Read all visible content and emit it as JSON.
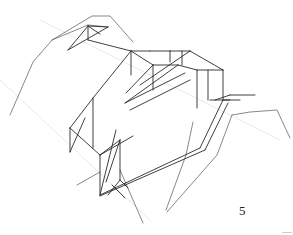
{
  "figure": {
    "label": "5",
    "stroke_color": "#2a2a2a",
    "light_stroke_color": "#6a6a6a",
    "faint_stroke_color": "#d8d8d8",
    "background": "#ffffff"
  },
  "chart_data": {
    "type": "diagram",
    "title": "",
    "annotations": [
      "5"
    ]
  },
  "terrain_polylines": [
    [
      [
        10,
        115
      ],
      [
        33,
        62
      ],
      [
        52,
        40
      ],
      [
        92,
        16
      ],
      [
        110,
        16
      ],
      [
        133,
        42
      ]
    ],
    [
      [
        52,
        40
      ],
      [
        88,
        25
      ],
      [
        108,
        27
      ]
    ],
    [
      [
        232,
        115
      ],
      [
        250,
        112
      ],
      [
        277,
        110
      ],
      [
        290,
        138
      ]
    ],
    [
      [
        232,
        115
      ],
      [
        217,
        155
      ],
      [
        167,
        212
      ]
    ],
    [
      [
        193,
        122
      ],
      [
        186,
        155
      ],
      [
        166,
        210
      ]
    ],
    [
      [
        77,
        185
      ],
      [
        100,
        172
      ]
    ],
    [
      [
        120,
        170
      ],
      [
        143,
        223
      ]
    ]
  ],
  "truss_lines": [
    [
      [
        68,
        50
      ],
      [
        88,
        26
      ]
    ],
    [
      [
        88,
        26
      ],
      [
        108,
        27
      ]
    ],
    [
      [
        88,
        26
      ],
      [
        100,
        34
      ]
    ],
    [
      [
        68,
        50
      ],
      [
        108,
        27
      ]
    ],
    [
      [
        88,
        26
      ],
      [
        88,
        40
      ]
    ],
    [
      [
        88,
        40
      ],
      [
        131,
        51
      ]
    ],
    [
      [
        131,
        51
      ],
      [
        131,
        75
      ]
    ],
    [
      [
        131,
        51
      ],
      [
        150,
        51
      ]
    ],
    [
      [
        131,
        51
      ],
      [
        93,
        98
      ]
    ],
    [
      [
        131,
        51
      ],
      [
        153,
        65
      ]
    ],
    [
      [
        150,
        51
      ],
      [
        170,
        51
      ]
    ],
    [
      [
        170,
        51
      ],
      [
        190,
        51
      ]
    ],
    [
      [
        190,
        51
      ],
      [
        223,
        70
      ]
    ],
    [
      [
        170,
        51
      ],
      [
        170,
        62
      ]
    ],
    [
      [
        182,
        51
      ],
      [
        182,
        65
      ]
    ],
    [
      [
        223,
        70
      ],
      [
        223,
        100
      ]
    ],
    [
      [
        223,
        70
      ],
      [
        197,
        70
      ]
    ],
    [
      [
        197,
        70
      ],
      [
        178,
        65
      ]
    ],
    [
      [
        153,
        65
      ],
      [
        178,
        65
      ]
    ],
    [
      [
        153,
        65
      ],
      [
        153,
        90
      ]
    ],
    [
      [
        153,
        65
      ],
      [
        126,
        93
      ]
    ],
    [
      [
        197,
        70
      ],
      [
        197,
        108
      ]
    ],
    [
      [
        208,
        70
      ],
      [
        208,
        100
      ]
    ],
    [
      [
        178,
        65
      ],
      [
        125,
        103
      ]
    ],
    [
      [
        190,
        51
      ],
      [
        140,
        85
      ]
    ],
    [
      [
        93,
        98
      ],
      [
        70,
        128
      ]
    ],
    [
      [
        93,
        98
      ],
      [
        93,
        148
      ]
    ],
    [
      [
        70,
        128
      ],
      [
        70,
        152
      ]
    ],
    [
      [
        70,
        128
      ],
      [
        100,
        155
      ]
    ],
    [
      [
        70,
        152
      ],
      [
        85,
        118
      ]
    ],
    [
      [
        100,
        155
      ],
      [
        133,
        136
      ]
    ],
    [
      [
        100,
        155
      ],
      [
        100,
        195
      ]
    ],
    [
      [
        100,
        155
      ],
      [
        120,
        140
      ]
    ],
    [
      [
        120,
        140
      ],
      [
        120,
        180
      ]
    ],
    [
      [
        120,
        140
      ],
      [
        106,
        182
      ]
    ],
    [
      [
        100,
        195
      ],
      [
        116,
        130
      ]
    ],
    [
      [
        100,
        195
      ],
      [
        200,
        148
      ]
    ],
    [
      [
        100,
        196
      ],
      [
        205,
        150
      ]
    ],
    [
      [
        125,
        103
      ],
      [
        185,
        73
      ]
    ],
    [
      [
        130,
        110
      ],
      [
        190,
        80
      ]
    ],
    [
      [
        200,
        148
      ],
      [
        223,
        100
      ]
    ],
    [
      [
        205,
        150
      ],
      [
        228,
        103
      ]
    ],
    [
      [
        223,
        100
      ],
      [
        240,
        100
      ]
    ],
    [
      [
        210,
        100
      ],
      [
        230,
        100
      ]
    ],
    [
      [
        215,
        100
      ],
      [
        230,
        95
      ]
    ],
    [
      [
        230,
        95
      ],
      [
        255,
        95
      ]
    ],
    [
      [
        120,
        180
      ],
      [
        108,
        195
      ]
    ],
    [
      [
        120,
        180
      ],
      [
        128,
        188
      ]
    ],
    [
      [
        112,
        185
      ],
      [
        125,
        198
      ]
    ]
  ],
  "faint_lines": [
    [
      [
        40,
        20
      ],
      [
        280,
        140
      ]
    ],
    [
      [
        0,
        80
      ],
      [
        150,
        220
      ]
    ]
  ]
}
